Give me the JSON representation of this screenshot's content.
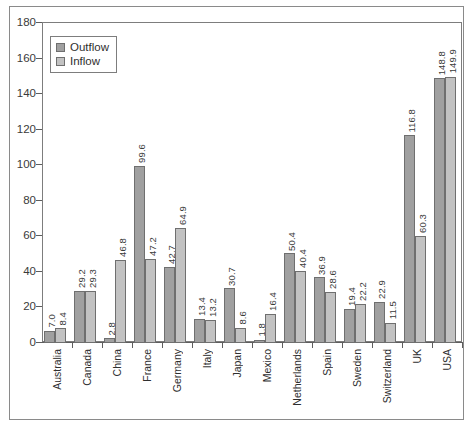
{
  "chart_data": {
    "type": "bar",
    "title": "",
    "xlabel": "",
    "ylabel": "",
    "ylim": [
      0,
      180
    ],
    "ytick_step": 20,
    "yticks": [
      "0",
      "20",
      "40",
      "60",
      "80",
      "100",
      "120",
      "140",
      "160",
      "180"
    ],
    "grid": false,
    "legend_position": "top-left",
    "categories": [
      "Australia",
      "Canada",
      "China",
      "France",
      "Germany",
      "Italy",
      "Japan",
      "Mexico",
      "Netherlands",
      "Spain",
      "Sweden",
      "Switzerland",
      "UK",
      "USA"
    ],
    "series": [
      {
        "name": "Outflow",
        "color": "#a0a0a0",
        "values": [
          7.0,
          29.2,
          2.8,
          99.6,
          42.7,
          13.4,
          30.7,
          1.8,
          50.4,
          36.9,
          19.4,
          22.9,
          116.8,
          148.8
        ],
        "labels": [
          "7.0",
          "29.2",
          "2.8",
          "99.6",
          "42.7",
          "13.4",
          "30.7",
          "1.8",
          "50.4",
          "36.9",
          "19.4",
          "22.9",
          "116.8",
          "148.8"
        ]
      },
      {
        "name": "Inflow",
        "color": "#c2c2c2",
        "values": [
          8.4,
          29.3,
          46.8,
          47.2,
          64.9,
          13.2,
          8.6,
          16.4,
          40.4,
          28.6,
          22.2,
          11.5,
          60.3,
          149.9
        ],
        "labels": [
          "8.4",
          "29.3",
          "46.8",
          "47.2",
          "64.9",
          "13.2",
          "8.6",
          "16.4",
          "40.4",
          "28.6",
          "22.2",
          "11.5",
          "60.3",
          "149.9"
        ]
      }
    ]
  },
  "legend": {
    "items": [
      {
        "label": "Outflow",
        "swatch_class": "outflow"
      },
      {
        "label": "Inflow",
        "swatch_class": "inflow"
      }
    ]
  }
}
